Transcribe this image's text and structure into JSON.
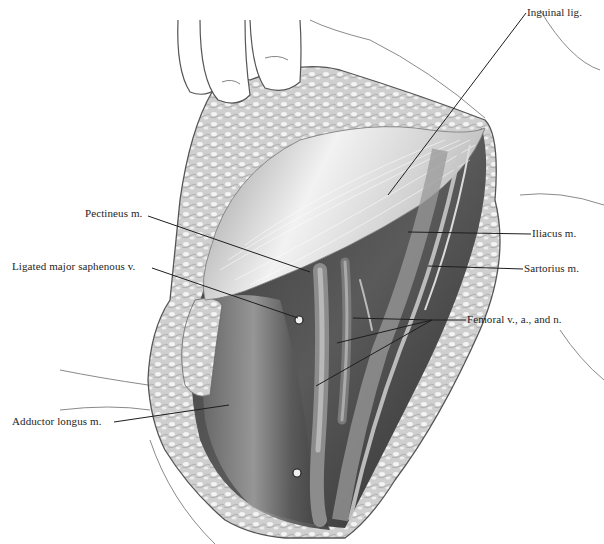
{
  "figure": {
    "type": "surgical anatomical illustration",
    "style": "grayscale pencil drawing",
    "labels": [
      {
        "id": "inguinal-lig",
        "text": "Inguinal lig.",
        "x": 527,
        "y": 6,
        "leaders": [
          [
            526,
            13,
            388,
            195
          ]
        ]
      },
      {
        "id": "pectineus",
        "text": "Pectineus m.",
        "x": 85,
        "y": 207,
        "leaders": [
          [
            148,
            216,
            310,
            272
          ]
        ]
      },
      {
        "id": "saphenous",
        "text": "Ligated major saphenous v.",
        "x": 12,
        "y": 260,
        "leaders": [
          [
            152,
            268,
            298,
            318
          ]
        ]
      },
      {
        "id": "iliacus",
        "text": "Iliacus m.",
        "x": 532,
        "y": 227,
        "leaders": [
          [
            531,
            234,
            408,
            232
          ]
        ]
      },
      {
        "id": "sartorius",
        "text": "Sartorius m.",
        "x": 524,
        "y": 262,
        "leaders": [
          [
            523,
            269,
            428,
            266
          ]
        ]
      },
      {
        "id": "femoral",
        "text": "Femoral v., a., and n.",
        "x": 467,
        "y": 313,
        "leaders": [
          [
            466,
            320,
            432,
            320
          ],
          [
            432,
            320,
            353,
            318
          ],
          [
            432,
            320,
            337,
            343
          ],
          [
            432,
            320,
            316,
            386
          ]
        ]
      },
      {
        "id": "adductor-longus",
        "text": "Adductor longus m.",
        "x": 12,
        "y": 415,
        "leaders": [
          [
            114,
            422,
            229,
            405
          ]
        ]
      }
    ],
    "colors": {
      "ink": "#1e1e1e",
      "skin_line": "#6a6a6a",
      "fat": "#c9c9c9",
      "muscle_dark": "#4a4a4a",
      "muscle_light": "#e6e6e6"
    }
  }
}
